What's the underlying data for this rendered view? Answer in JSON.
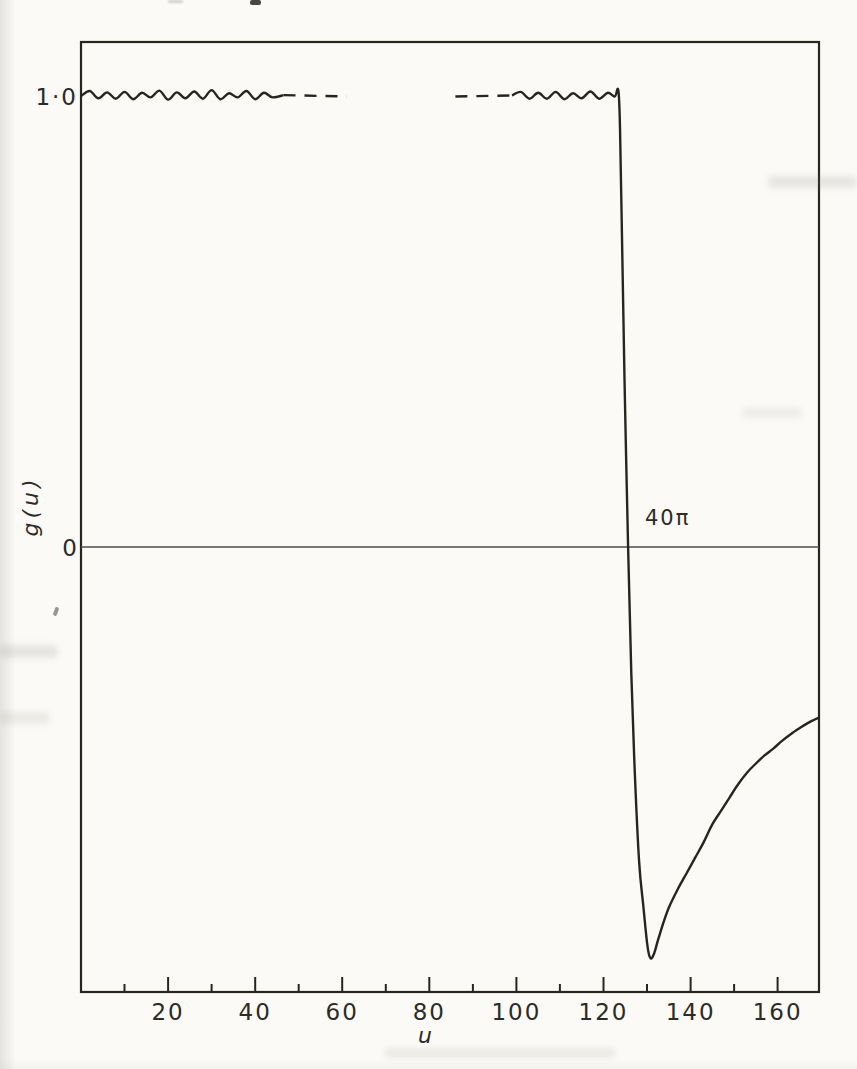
{
  "figure": {
    "y_axis": {
      "top_label": "1·0",
      "zero_label": "0",
      "axis_label": "g(u)"
    },
    "x_axis": {
      "axis_label": "u"
    },
    "annotation": "40π"
  },
  "colors": {
    "ink": "#26261f",
    "paper": "#fbfaf7",
    "zero_line": "#4d4d4d"
  },
  "chart_data": {
    "type": "line",
    "title": "",
    "xlabel": "u",
    "ylabel": "g(u)",
    "xlim": [
      0,
      169.5
    ],
    "ylim": [
      -0.99,
      1.12
    ],
    "grid": false,
    "zero_line": true,
    "x_major_ticks": [
      20,
      40,
      60,
      80,
      100,
      120,
      140,
      160
    ],
    "x_major_tick_labels": [
      "20",
      "40",
      "60",
      "80",
      "100",
      "120",
      "140",
      "160"
    ],
    "x_minor_ticks": [
      10,
      30,
      50,
      70,
      90,
      110,
      130,
      150
    ],
    "y_labeled_values": [
      {
        "value": 1.0,
        "label": "1·0"
      },
      {
        "value": 0.0,
        "label": "0"
      }
    ],
    "annotations": [
      {
        "text": "40π",
        "u": 129.5,
        "g": 0.05
      }
    ],
    "series": [
      {
        "name": "g-plateau-left-solid",
        "style": "solid",
        "points": [
          [
            0,
            1.0
          ],
          [
            2,
            1.011
          ],
          [
            4,
            0.995
          ],
          [
            6,
            1.008
          ],
          [
            8,
            0.994
          ],
          [
            10,
            1.009
          ],
          [
            12,
            0.993
          ],
          [
            14,
            1.007
          ],
          [
            16,
            0.997
          ],
          [
            18,
            1.012
          ],
          [
            20,
            0.992
          ],
          [
            22,
            1.008
          ],
          [
            24,
            0.995
          ],
          [
            26,
            1.01
          ],
          [
            28,
            0.994
          ],
          [
            30,
            1.013
          ],
          [
            32,
            0.993
          ],
          [
            34,
            1.006
          ],
          [
            36,
            0.997
          ],
          [
            38,
            1.011
          ],
          [
            40,
            0.993
          ],
          [
            42,
            1.007
          ],
          [
            44,
            0.997
          ],
          [
            46.5,
            1.002
          ]
        ]
      },
      {
        "name": "g-plateau-left-dashed",
        "style": "dashed",
        "points": [
          [
            46.5,
            1.002
          ],
          [
            61,
            0.999
          ]
        ]
      },
      {
        "name": "g-plateau-right-dashed",
        "style": "dashed",
        "points": [
          [
            86,
            0.999
          ],
          [
            99,
            1.001
          ]
        ]
      },
      {
        "name": "g-main-solid",
        "style": "solid",
        "points": [
          [
            99,
            1.001
          ],
          [
            101,
            1.009
          ],
          [
            103,
            0.994
          ],
          [
            105,
            1.007
          ],
          [
            107,
            0.994
          ],
          [
            109,
            1.009
          ],
          [
            111,
            0.993
          ],
          [
            113,
            1.006
          ],
          [
            115,
            0.995
          ],
          [
            117,
            1.01
          ],
          [
            119,
            0.994
          ],
          [
            121,
            1.007
          ],
          [
            122.6,
            0.999
          ],
          [
            123.4,
            1.013
          ],
          [
            123.8,
            0.93
          ],
          [
            124.3,
            0.66
          ],
          [
            124.9,
            0.34
          ],
          [
            125.66,
            0.0
          ],
          [
            126.4,
            -0.28
          ],
          [
            127.2,
            -0.5
          ],
          [
            128.2,
            -0.7
          ],
          [
            129.2,
            -0.8
          ],
          [
            130.1,
            -0.885
          ],
          [
            130.8,
            -0.912
          ],
          [
            131.6,
            -0.902
          ],
          [
            132.5,
            -0.872
          ],
          [
            133.6,
            -0.838
          ],
          [
            135,
            -0.8
          ],
          [
            137,
            -0.76
          ],
          [
            139,
            -0.725
          ],
          [
            141,
            -0.69
          ],
          [
            143,
            -0.655
          ],
          [
            145,
            -0.615
          ],
          [
            147,
            -0.585
          ],
          [
            149,
            -0.555
          ],
          [
            151,
            -0.525
          ],
          [
            153,
            -0.5
          ],
          [
            155,
            -0.48
          ],
          [
            157,
            -0.462
          ],
          [
            159,
            -0.447
          ],
          [
            161,
            -0.43
          ],
          [
            163,
            -0.415
          ],
          [
            165,
            -0.402
          ],
          [
            167,
            -0.39
          ],
          [
            169.5,
            -0.378
          ]
        ]
      }
    ]
  }
}
